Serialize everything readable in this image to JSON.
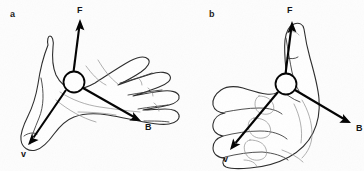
{
  "figure": {
    "background_color": "#fdfdfd",
    "ink_color": "#000000",
    "outline_color": "#2b2b2b",
    "width": 364,
    "height": 171
  },
  "panels": [
    {
      "letter": "a",
      "hand_pose": "open-flat-hand-palm-up-fingers-right-thumb-lower-left",
      "junction": {
        "cx": 74,
        "cy": 82,
        "r": 10.5
      },
      "vectors": [
        {
          "name": "F",
          "label": "F",
          "label_x": 77,
          "label_y": 6,
          "from_x": 73,
          "from_y": 72,
          "to_x": 80,
          "to_y": 19
        },
        {
          "name": "B",
          "label": "B",
          "label_x": 145,
          "label_y": 123,
          "from_x": 83,
          "from_y": 88,
          "to_x": 141,
          "to_y": 121
        },
        {
          "name": "v",
          "label": "v",
          "label_x": 21,
          "label_y": 150,
          "from_x": 66,
          "from_y": 90,
          "to_x": 28,
          "to_y": 145
        }
      ]
    },
    {
      "letter": "b",
      "hand_pose": "closed-fist-thumbs-up-thumb-pointing-upward",
      "junction": {
        "cx": 104,
        "cy": 84,
        "r": 10.5
      },
      "vectors": [
        {
          "name": "F",
          "label": "F",
          "label_x": 105,
          "label_y": 6,
          "from_x": 103,
          "from_y": 74,
          "to_x": 110,
          "to_y": 21
        },
        {
          "name": "B",
          "label": "B",
          "label_x": 174,
          "label_y": 124,
          "from_x": 113,
          "from_y": 90,
          "to_x": 169,
          "to_y": 123
        },
        {
          "name": "v",
          "label": "v",
          "label_x": 41,
          "label_y": 155,
          "from_x": 96,
          "from_y": 92,
          "to_x": 48,
          "to_y": 150
        }
      ]
    }
  ]
}
